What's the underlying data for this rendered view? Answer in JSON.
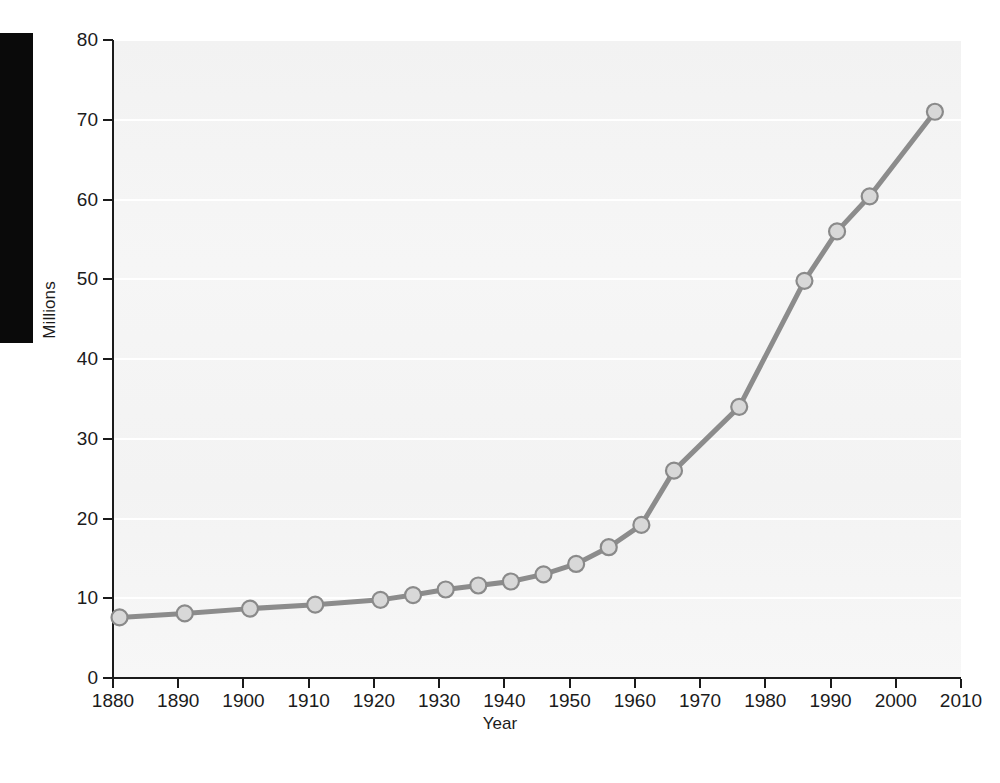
{
  "chart_data": {
    "type": "line",
    "title": "",
    "xlabel": "Year",
    "ylabel": "Millions",
    "xlim": [
      1880,
      2010
    ],
    "ylim": [
      0,
      80
    ],
    "xticks": [
      1880,
      1890,
      1900,
      1910,
      1920,
      1930,
      1940,
      1950,
      1960,
      1970,
      1980,
      1990,
      2000,
      2010
    ],
    "yticks": [
      0,
      10,
      20,
      30,
      40,
      50,
      60,
      70,
      80
    ],
    "xtick_labels": [
      "1880",
      "1890",
      "1900",
      "1910",
      "1920",
      "1930",
      "1940",
      "1950",
      "1960",
      "1970",
      "1980",
      "1990",
      "2000",
      "2010"
    ],
    "ytick_labels": [
      "0",
      "10",
      "20",
      "30",
      "40",
      "50",
      "60",
      "70",
      "80"
    ],
    "grid": true,
    "grid_axis": "y",
    "legend": false,
    "marker": "circle",
    "x": [
      1881,
      1891,
      1901,
      1911,
      1921,
      1926,
      1931,
      1936,
      1941,
      1946,
      1951,
      1956,
      1961,
      1966,
      1976,
      1986,
      1991,
      1996,
      2006
    ],
    "values": [
      7.6,
      8.1,
      8.7,
      9.2,
      9.8,
      10.4,
      11.1,
      11.6,
      12.1,
      13.0,
      14.3,
      16.4,
      19.2,
      26.0,
      34.0,
      49.8,
      56.0,
      60.4,
      71.0
    ],
    "series": [
      {
        "name": "Millions",
        "x": [
          1881,
          1891,
          1901,
          1911,
          1921,
          1926,
          1931,
          1936,
          1941,
          1946,
          1951,
          1956,
          1961,
          1966,
          1976,
          1986,
          1991,
          1996,
          2006
        ],
        "values": [
          7.6,
          8.1,
          8.7,
          9.2,
          9.8,
          10.4,
          11.1,
          11.6,
          12.1,
          13.0,
          14.3,
          16.4,
          19.2,
          26.0,
          34.0,
          49.8,
          56.0,
          60.4,
          71.0
        ]
      }
    ],
    "colors": {
      "line": "#8c8c8c",
      "marker_fill": "#d8d8d8",
      "marker_edge": "#8a8a8a",
      "plot_background": "#f4f4f4",
      "gridline": "#ffffff",
      "axis": "#1b1b1b",
      "text": "#1b1b1b",
      "margin_block": "#0a0a0a"
    }
  }
}
